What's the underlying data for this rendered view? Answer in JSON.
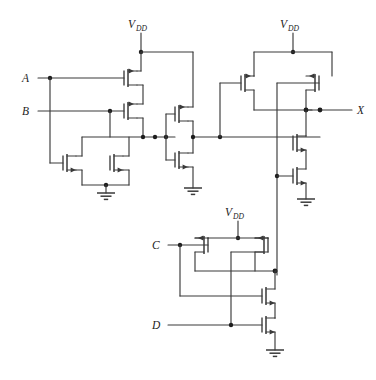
{
  "figure": {
    "kind": "cmos-transistor-schematic",
    "title": "",
    "background_color": "#ffffff",
    "wire_color": "#3a3a3a",
    "node_dot_color": "#1d1d1d",
    "width": 376,
    "height": 380
  },
  "labels": {
    "input_a": "A",
    "input_b": "B",
    "input_c": "C",
    "input_d": "D",
    "output_x": "X",
    "supply": "V",
    "supply_sub": "DD"
  },
  "supplies": [
    {
      "name": "vdd-left",
      "text": "V",
      "sub": "DD"
    },
    {
      "name": "vdd-right",
      "text": "V",
      "sub": "DD"
    },
    {
      "name": "vdd-bottom",
      "text": "V",
      "sub": "DD"
    }
  ],
  "grounds": [
    {
      "name": "gnd-left"
    },
    {
      "name": "gnd-mid"
    },
    {
      "name": "gnd-right"
    },
    {
      "name": "gnd-bottom"
    }
  ],
  "transistors": [
    {
      "name": "pmos-a",
      "type": "pmos",
      "gate_input": "A"
    },
    {
      "name": "pmos-b",
      "type": "pmos",
      "gate_input": "B"
    },
    {
      "name": "nmos-a",
      "type": "nmos",
      "gate_input": "A"
    },
    {
      "name": "nmos-b",
      "type": "nmos",
      "gate_input": "B"
    },
    {
      "name": "pmos-inv",
      "type": "pmos",
      "gate_input": "node-ab"
    },
    {
      "name": "nmos-inv",
      "type": "nmos",
      "gate_input": "node-ab"
    },
    {
      "name": "pmos-x1",
      "type": "pmos",
      "gate_input": "node-inv"
    },
    {
      "name": "pmos-x2",
      "type": "pmos",
      "gate_input": "node-cd"
    },
    {
      "name": "nmos-x1",
      "type": "nmos",
      "gate_input": "node-inv"
    },
    {
      "name": "nmos-x2",
      "type": "nmos",
      "gate_input": "node-cd"
    },
    {
      "name": "pmos-c",
      "type": "pmos",
      "gate_input": "C"
    },
    {
      "name": "pmos-d",
      "type": "pmos",
      "gate_input": "D"
    },
    {
      "name": "nmos-c",
      "type": "nmos",
      "gate_input": "C"
    },
    {
      "name": "nmos-d",
      "type": "nmos",
      "gate_input": "D"
    }
  ]
}
